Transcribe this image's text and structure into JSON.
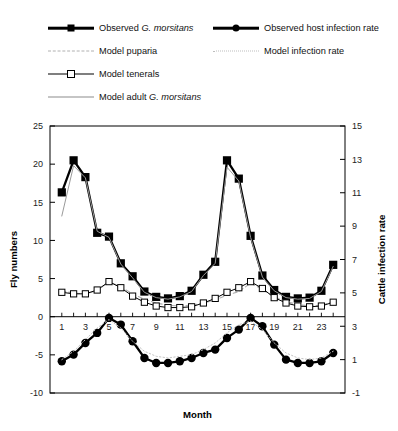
{
  "chart_data": {
    "type": "line",
    "title": "",
    "xlabel": "Month",
    "ylabel": "Fly numbers",
    "y2label": "Cattle infection rate",
    "xlim": [
      0,
      25
    ],
    "ylim": [
      -10,
      25
    ],
    "y2lim": [
      -1,
      15
    ],
    "yticks": [
      -10,
      -5,
      0,
      5,
      10,
      15,
      20,
      25
    ],
    "y2ticks": [
      -1,
      1,
      3,
      5,
      7,
      9,
      11,
      13,
      15
    ],
    "xticks": [
      1,
      3,
      5,
      7,
      9,
      11,
      13,
      15,
      17,
      19,
      21,
      23
    ],
    "xtick_labels": [
      "1",
      "3",
      "5",
      "7",
      "9",
      "11",
      "13",
      "15",
      "17",
      "19",
      "21",
      "23"
    ],
    "ytick_labels": [
      "-10",
      "-5",
      "0",
      "5",
      "10",
      "15",
      "20",
      "25"
    ],
    "y2tick_labels": [
      "-1",
      "1",
      "3",
      "5",
      "7",
      "9",
      "11",
      "13",
      "15"
    ],
    "grid": false,
    "legend_position": "above-plot",
    "x": [
      1,
      2,
      3,
      4,
      5,
      6,
      7,
      8,
      9,
      10,
      11,
      12,
      13,
      14,
      15,
      16,
      17,
      18,
      19,
      20,
      21,
      22,
      23,
      24
    ],
    "series": [
      {
        "name": "Observed G. morsitans",
        "axis": "left",
        "marker": "filled-square",
        "color": "#000000",
        "values": [
          16.3,
          20.5,
          18.3,
          11.0,
          10.5,
          7.0,
          5.3,
          3.3,
          2.6,
          2.4,
          2.7,
          3.4,
          5.5,
          7.2,
          20.5,
          18.1,
          10.6,
          5.4,
          3.5,
          2.6,
          2.4,
          2.5,
          3.4,
          6.8
        ]
      },
      {
        "name": "Observed host infection rate",
        "axis": "right",
        "marker": "filled-circle",
        "color": "#000000",
        "values": [
          0.9,
          1.3,
          2.0,
          2.6,
          3.5,
          3.1,
          2.1,
          1.1,
          0.8,
          0.8,
          0.9,
          1.1,
          1.4,
          1.6,
          2.3,
          2.8,
          3.5,
          3.0,
          1.9,
          1.0,
          0.8,
          0.8,
          0.9,
          1.4
        ]
      },
      {
        "name": "Model puparia",
        "axis": "left",
        "marker": "none",
        "linestyle": "dashed",
        "color": "#b0b0b0",
        "values": [
          3.4,
          3.1,
          3.0,
          3.4,
          4.6,
          3.9,
          3.0,
          2.3,
          1.8,
          1.5,
          1.4,
          1.5,
          1.8,
          2.2,
          2.8,
          3.3,
          4.4,
          3.6,
          2.6,
          2.0,
          1.6,
          1.4,
          1.5,
          2.0
        ]
      },
      {
        "name": "Model tenerals",
        "axis": "left",
        "marker": "open-square",
        "linestyle": "solid",
        "color": "#000000",
        "values": [
          3.2,
          3.0,
          3.0,
          3.5,
          4.6,
          3.8,
          2.7,
          1.9,
          1.4,
          1.2,
          1.2,
          1.3,
          1.8,
          2.4,
          3.2,
          3.8,
          4.6,
          3.7,
          2.5,
          1.8,
          1.4,
          1.3,
          1.4,
          1.9
        ]
      },
      {
        "name": "Model adult G. morsitans",
        "axis": "left",
        "marker": "none",
        "linestyle": "solid",
        "color": "#9a9a9a",
        "values": [
          13.2,
          19.8,
          18.2,
          11.2,
          10.4,
          6.9,
          5.1,
          3.2,
          2.5,
          2.3,
          2.6,
          3.3,
          5.4,
          7.0,
          19.6,
          17.8,
          10.4,
          5.2,
          3.4,
          2.5,
          2.3,
          2.4,
          3.3,
          6.6
        ]
      },
      {
        "name": "Model infection rate",
        "axis": "right",
        "marker": "none",
        "linestyle": "dotted",
        "color": "#c4c4c4",
        "values": [
          1.0,
          1.5,
          2.2,
          2.9,
          3.4,
          2.9,
          2.1,
          1.5,
          1.2,
          1.1,
          1.2,
          1.3,
          1.6,
          2.0,
          2.6,
          3.1,
          3.3,
          2.8,
          2.0,
          1.4,
          1.1,
          1.0,
          1.1,
          1.5
        ]
      }
    ]
  },
  "legend": {
    "items": [
      {
        "label_pre": "Observed ",
        "label_em": "G. morsitans",
        "label_post": "",
        "sample": "thick-line-filled-square",
        "row": 0,
        "col": 0
      },
      {
        "label_pre": "Observed host infection rate",
        "label_em": "",
        "label_post": "",
        "sample": "thick-line-filled-circle",
        "row": 0,
        "col": 1
      },
      {
        "label_pre": "Model puparia",
        "label_em": "",
        "label_post": "",
        "sample": "dashed-grey-line",
        "row": 1,
        "col": 0
      },
      {
        "label_pre": "Model infection rate",
        "label_em": "",
        "label_post": "",
        "sample": "dotted-grey-line",
        "row": 1,
        "col": 1
      },
      {
        "label_pre": "Model tenerals",
        "label_em": "",
        "label_post": "",
        "sample": "line-open-square",
        "row": 2,
        "col": 0
      },
      {
        "label_pre": "Model adult ",
        "label_em": "G. morsitans",
        "label_post": "",
        "sample": "thin-grey-line",
        "row": 3,
        "col": 0
      }
    ]
  },
  "axes": {
    "x_title": "Month",
    "y_left_title": "Fly numbers",
    "y_right_title": "Cattle infection rate"
  }
}
